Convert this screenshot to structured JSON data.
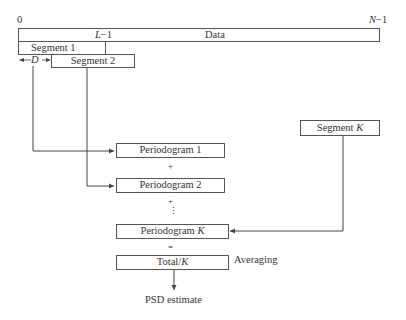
{
  "diagram": {
    "type": "welch-method-flow",
    "axis": {
      "start_label": "0",
      "end_label": "N−1",
      "segment_end_label": "L−1",
      "data_label": "Data"
    },
    "segments": [
      {
        "label": "Segment 1"
      },
      {
        "label": "Segment 2"
      },
      {
        "label": "Segment K"
      }
    ],
    "offset_label": "D",
    "periodograms": [
      {
        "label": "Periodogram 1"
      },
      {
        "label": "Periodogram 2"
      },
      {
        "label": "Periodogram K"
      }
    ],
    "operators": {
      "plus1": "+",
      "plus2": "+",
      "ellipsis": "⋮",
      "equals": "="
    },
    "total": {
      "label": "Total/K"
    },
    "averaging_label": "Averaging",
    "output_label": "PSD estimate",
    "colors": {
      "line": "#444444",
      "text": "#333333",
      "background": "#ffffff"
    }
  }
}
